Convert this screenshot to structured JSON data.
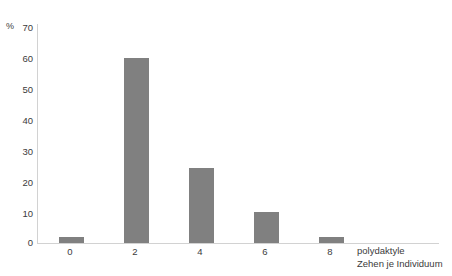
{
  "chart_data": {
    "type": "bar",
    "title": "",
    "subtitle": "",
    "categories": [
      "0",
      "2",
      "4",
      "6",
      "8"
    ],
    "values": [
      2,
      59,
      24,
      10,
      2
    ],
    "series": [
      {
        "name": "Anteil",
        "values": [
          2,
          59,
          24,
          10,
          2
        ]
      }
    ],
    "xlabel_line1": "polydaktyle",
    "xlabel_line2": "Zehen je Individuum",
    "ylabel": "%",
    "ylim": [
      0,
      70
    ],
    "y_ticks": [
      "0",
      "10",
      "20",
      "30",
      "40",
      "50",
      "60",
      "70"
    ],
    "y_tick_values": [
      0,
      10,
      20,
      30,
      40,
      50,
      60,
      70
    ],
    "x_ticks": [
      "0",
      "2",
      "4",
      "6",
      "8"
    ],
    "grid": false,
    "legend": "none",
    "bar_color": "#808080",
    "axis_color": "#d2d2d2",
    "text_color": "#3b3b3b",
    "background": "#ffffff"
  }
}
